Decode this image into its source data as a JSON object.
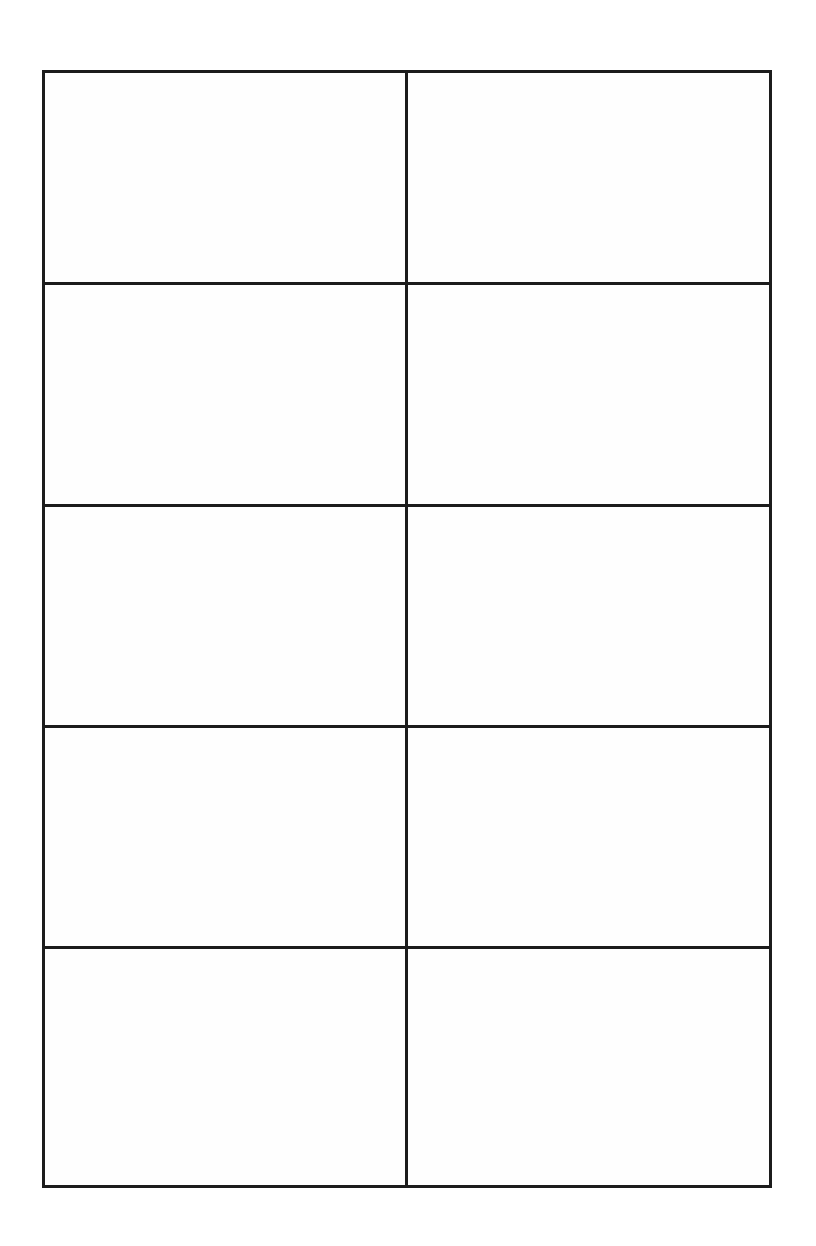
{
  "page": {
    "background_color": "#ffffff",
    "title": ""
  },
  "grid": {
    "rows": 5,
    "columns": 2,
    "border_color": "#1c1c1c",
    "cell_background": "#fefefe",
    "cells": [
      [
        "",
        ""
      ],
      [
        "",
        ""
      ],
      [
        "",
        ""
      ],
      [
        "",
        ""
      ],
      [
        "",
        ""
      ]
    ]
  }
}
